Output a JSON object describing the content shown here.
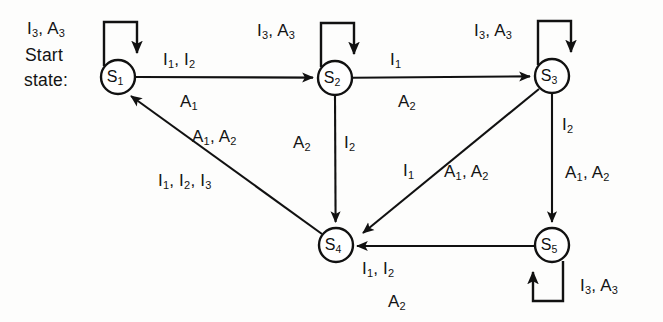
{
  "diagram": {
    "type": "state-transition-diagram",
    "canvas": {
      "width": 663,
      "height": 322
    },
    "colors": {
      "stroke": "#111111",
      "background": "#fdfdfc",
      "node_fill": "#ffffff"
    },
    "start_label_line1": "Start",
    "start_label_line2": "state:",
    "states": [
      {
        "id": "S1",
        "base": "S",
        "sub": "1",
        "cx": 118,
        "cy": 77,
        "r": 17
      },
      {
        "id": "S2",
        "base": "S",
        "sub": "2",
        "cx": 335,
        "cy": 78,
        "r": 17
      },
      {
        "id": "S3",
        "base": "S",
        "sub": "3",
        "cx": 552,
        "cy": 76,
        "r": 17
      },
      {
        "id": "S4",
        "base": "S",
        "sub": "4",
        "cx": 336,
        "cy": 245,
        "r": 17
      },
      {
        "id": "S5",
        "base": "S",
        "sub": "5",
        "cx": 552,
        "cy": 245,
        "r": 17
      }
    ],
    "edges": [
      {
        "from": "S1",
        "to": "S1",
        "kind": "self-loop",
        "labels": [
          "I3, A3"
        ]
      },
      {
        "from": "S1",
        "to": "S2",
        "kind": "straight",
        "labels": [
          "I1, I2",
          "A1"
        ]
      },
      {
        "from": "S2",
        "to": "S2",
        "kind": "self-loop",
        "labels": [
          "I3, A3"
        ]
      },
      {
        "from": "S2",
        "to": "S3",
        "kind": "straight",
        "labels": [
          "I1",
          "A2"
        ]
      },
      {
        "from": "S2",
        "to": "S4",
        "kind": "straight",
        "labels": [
          "A2",
          "I2"
        ]
      },
      {
        "from": "S3",
        "to": "S3",
        "kind": "self-loop",
        "labels": [
          "I3, A3"
        ]
      },
      {
        "from": "S3",
        "to": "S4",
        "kind": "diagonal",
        "labels": [
          "I1",
          "A1, A2"
        ]
      },
      {
        "from": "S3",
        "to": "S5",
        "kind": "straight",
        "labels": [
          "I2",
          "A1, A2"
        ]
      },
      {
        "from": "S4",
        "to": "S1",
        "kind": "diagonal",
        "labels": [
          "A1, A2",
          "I1, I2, I3"
        ]
      },
      {
        "from": "S5",
        "to": "S4",
        "kind": "straight",
        "labels": [
          "I1, I2",
          "A2"
        ]
      },
      {
        "from": "S5",
        "to": "S5",
        "kind": "self-loop",
        "labels": [
          "I3, A3"
        ]
      }
    ],
    "labels": [
      {
        "name": "label-s1-selfloop",
        "text_html": "I<sub>3</sub>, A<sub>3</sub>",
        "x": 27,
        "y": 20
      },
      {
        "name": "label-start-line1",
        "text_html": "Start",
        "x": 25,
        "y": 47
      },
      {
        "name": "label-start-line2",
        "text_html": "state:",
        "x": 24,
        "y": 72
      },
      {
        "name": "label-s1-s2-top",
        "text_html": "I<sub>1</sub>, I<sub>2</sub>",
        "x": 163,
        "y": 51
      },
      {
        "name": "label-s1-s2-bottom",
        "text_html": "A<sub>1</sub>",
        "x": 180,
        "y": 93
      },
      {
        "name": "label-s2-selfloop",
        "text_html": "I<sub>3</sub>, A<sub>3</sub>",
        "x": 257,
        "y": 22
      },
      {
        "name": "label-s2-s3-top",
        "text_html": "I<sub>1</sub>",
        "x": 390,
        "y": 51
      },
      {
        "name": "label-s2-s3-bottom",
        "text_html": "A<sub>2</sub>",
        "x": 398,
        "y": 93
      },
      {
        "name": "label-s3-selfloop",
        "text_html": "I<sub>3</sub>, A<sub>3</sub>",
        "x": 474,
        "y": 22
      },
      {
        "name": "label-s4-s1-upper",
        "text_html": "A<sub>1</sub>, A<sub>2</sub>",
        "x": 192,
        "y": 128
      },
      {
        "name": "label-s4-s1-lower",
        "text_html": "I<sub>1</sub>, I<sub>2</sub>, I<sub>3</sub>",
        "x": 158,
        "y": 172
      },
      {
        "name": "label-s2-s4-left",
        "text_html": "A<sub>2</sub>",
        "x": 293,
        "y": 134
      },
      {
        "name": "label-s2-s4-right",
        "text_html": "I<sub>2</sub>",
        "x": 344,
        "y": 134
      },
      {
        "name": "label-s3-s4-left",
        "text_html": "I<sub>1</sub>",
        "x": 403,
        "y": 162
      },
      {
        "name": "label-s3-s4-right",
        "text_html": "A<sub>1</sub>, A<sub>2</sub>",
        "x": 444,
        "y": 163
      },
      {
        "name": "label-s3-s5-upper",
        "text_html": "I<sub>2</sub>",
        "x": 562,
        "y": 116
      },
      {
        "name": "label-s3-s5-lower",
        "text_html": "A<sub>1</sub>, A<sub>2</sub>",
        "x": 565,
        "y": 164
      },
      {
        "name": "label-s5-s4-upper",
        "text_html": "I<sub>1</sub>, I<sub>2</sub>",
        "x": 362,
        "y": 260
      },
      {
        "name": "label-s5-s4-lower",
        "text_html": "A<sub>2</sub>",
        "x": 388,
        "y": 293
      },
      {
        "name": "label-s5-selfloop",
        "text_html": "I<sub>3</sub>, A<sub>3</sub>",
        "x": 580,
        "y": 277
      }
    ]
  }
}
